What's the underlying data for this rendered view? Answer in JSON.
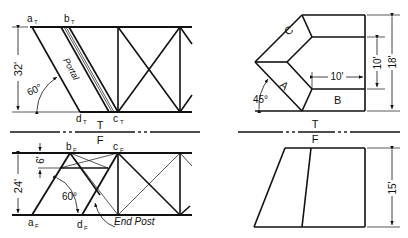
{
  "figure": {
    "left_top_view": {
      "points": {
        "a": "a",
        "a_sub": "T",
        "b": "b",
        "b_sub": "T",
        "c": "c",
        "c_sub": "T",
        "d": "d",
        "d_sub": "T"
      },
      "dimension_height": "32'",
      "angle": "60°",
      "member_label": "Portal"
    },
    "left_front_view": {
      "points": {
        "a": "a",
        "a_sub": "F",
        "b": "b",
        "b_sub": "F",
        "c": "c",
        "c_sub": "F",
        "d": "d",
        "d_sub": "F"
      },
      "dimension_height": "24'",
      "dimension_small": "6'",
      "angle": "60°",
      "member_label": "End Post"
    },
    "right_top_view": {
      "faces": [
        "A",
        "B",
        "C"
      ],
      "dimension_width": "10'",
      "dimension_inner": "10'",
      "dimension_height": "18'",
      "angle": "45°"
    },
    "right_front_view": {
      "dimension_height": "15'"
    },
    "fold_line": {
      "top_label": "T",
      "bottom_label": "F"
    }
  },
  "colors": {
    "line": "#111111",
    "background": "#ffffff"
  }
}
